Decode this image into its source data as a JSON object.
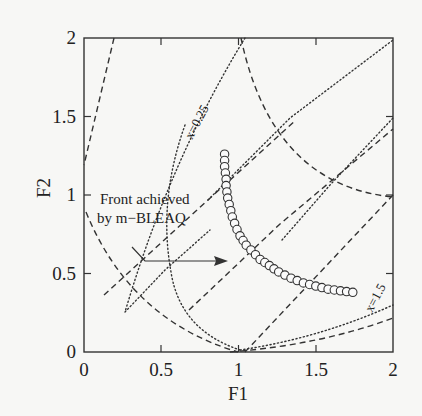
{
  "chart_data": {
    "type": "scatter",
    "title": "",
    "xlabel": "F1",
    "ylabel": "F2",
    "xlim": [
      0,
      2
    ],
    "ylim": [
      0,
      2
    ],
    "x_ticks": [
      "0",
      "0.5",
      "1",
      "1.5",
      "2"
    ],
    "y_ticks": [
      "0",
      "0.5",
      "1",
      "1.5",
      "2"
    ],
    "grid": false,
    "annotations": [
      {
        "text": "Front achieved",
        "line2": "by m−BLEAQ",
        "points_to": [
          0.92,
          0.98
        ]
      },
      {
        "text": "x=0.25",
        "position": [
          0.9,
          1.35
        ]
      },
      {
        "text": "x=1.5",
        "position": [
          1.85,
          0.38
        ]
      }
    ],
    "series": [
      {
        "name": "Front achieved by m-BLEAQ",
        "style": "open-circles",
        "x": [
          0.91,
          0.91,
          0.91,
          0.915,
          0.92,
          0.92,
          0.925,
          0.93,
          0.94,
          0.95,
          0.96,
          0.975,
          0.99,
          1.01,
          1.03,
          1.05,
          1.08,
          1.11,
          1.14,
          1.17,
          1.2,
          1.23,
          1.26,
          1.3,
          1.34,
          1.38,
          1.42,
          1.46,
          1.5,
          1.54,
          1.58,
          1.62,
          1.66,
          1.7,
          1.74
        ],
        "y": [
          1.26,
          1.22,
          1.18,
          1.14,
          1.1,
          1.06,
          1.02,
          0.98,
          0.94,
          0.9,
          0.86,
          0.82,
          0.78,
          0.74,
          0.71,
          0.68,
          0.65,
          0.62,
          0.59,
          0.57,
          0.55,
          0.53,
          0.51,
          0.49,
          0.47,
          0.455,
          0.44,
          0.43,
          0.42,
          0.41,
          0.4,
          0.395,
          0.39,
          0.385,
          0.38
        ]
      }
    ]
  },
  "labels": {
    "front_line1": "Front achieved",
    "front_line2": "by m−BLEAQ",
    "x025": "x=0.25",
    "x15": "x=1.5",
    "xlabel": "F1",
    "ylabel": "F2",
    "xt0": "0",
    "xt1": "0.5",
    "xt2": "1",
    "xt3": "1.5",
    "xt4": "2",
    "yt0": "0",
    "yt1": "0.5",
    "yt2": "1",
    "yt3": "1.5",
    "yt4": "2"
  }
}
